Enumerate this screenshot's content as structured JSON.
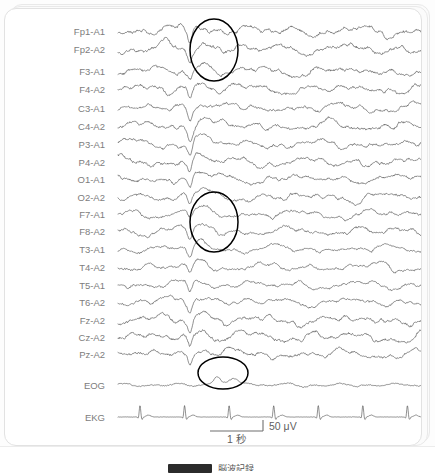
{
  "figure": {
    "background_color": "#ffffff",
    "trace_color": "#4a4a4a",
    "label_color": "#7d7d7d",
    "annotation_color": "#000000"
  },
  "channels": [
    {
      "label": "Fp1-A1",
      "y": 22,
      "amp": 5.0,
      "kind": "eeg"
    },
    {
      "label": "Fp2-A2",
      "y": 40,
      "amp": 5.2,
      "kind": "eeg"
    },
    {
      "label": "F3-A1",
      "y": 62,
      "amp": 4.6,
      "kind": "eeg"
    },
    {
      "label": "F4-A2",
      "y": 80,
      "amp": 4.8,
      "kind": "eeg"
    },
    {
      "label": "C3-A1",
      "y": 99,
      "amp": 4.4,
      "kind": "eeg"
    },
    {
      "label": "C4-A2",
      "y": 117,
      "amp": 4.6,
      "kind": "eeg"
    },
    {
      "label": "P3-A1",
      "y": 135,
      "amp": 4.3,
      "kind": "eeg"
    },
    {
      "label": "P4-A2",
      "y": 153,
      "amp": 4.5,
      "kind": "eeg"
    },
    {
      "label": "O1-A1",
      "y": 170,
      "amp": 4.2,
      "kind": "eeg"
    },
    {
      "label": "O2-A2",
      "y": 188,
      "amp": 4.4,
      "kind": "eeg"
    },
    {
      "label": "F7-A1",
      "y": 205,
      "amp": 4.0,
      "kind": "eeg"
    },
    {
      "label": "F8-A2",
      "y": 222,
      "amp": 4.1,
      "kind": "eeg"
    },
    {
      "label": "T3-A1",
      "y": 240,
      "amp": 3.6,
      "kind": "eeg"
    },
    {
      "label": "T4-A2",
      "y": 258,
      "amp": 3.8,
      "kind": "eeg"
    },
    {
      "label": "T5-A1",
      "y": 276,
      "amp": 3.7,
      "kind": "eeg"
    },
    {
      "label": "T6-A2",
      "y": 293,
      "amp": 3.9,
      "kind": "eeg"
    },
    {
      "label": "Fz-A2",
      "y": 311,
      "amp": 4.7,
      "kind": "eeg"
    },
    {
      "label": "Cz-A2",
      "y": 328,
      "amp": 4.9,
      "kind": "eeg"
    },
    {
      "label": "Pz-A2",
      "y": 345,
      "amp": 4.5,
      "kind": "eeg"
    },
    {
      "label": "EOG",
      "y": 376,
      "amp": 3.0,
      "kind": "eog"
    },
    {
      "label": "EKG",
      "y": 408,
      "amp": 1.0,
      "kind": "ekg"
    }
  ],
  "annotations": [
    {
      "name": "frontal-discharge",
      "cx": 209,
      "cy": 41,
      "rx": 24,
      "ry": 31
    },
    {
      "name": "temporal-discharge",
      "cx": 209,
      "cy": 213,
      "rx": 24,
      "ry": 30
    },
    {
      "name": "eog-deflection",
      "cx": 218,
      "cy": 364,
      "rx": 25,
      "ry": 16
    }
  ],
  "scale_bar": {
    "amplitude_label": "50 μV",
    "time_label": "1 秒",
    "x_start": 205,
    "x_end": 258,
    "y": 422,
    "tick_height": 11
  },
  "trace_area": {
    "x_start": 113,
    "x_end": 425,
    "label_right": 100
  },
  "banner": {
    "text": "脳波記録"
  },
  "chart_data": {
    "type": "line",
    "xlabel": "Time",
    "ylabel": "Channel",
    "x_unit": "second",
    "y_unit": "microvolt",
    "grid": false,
    "legend": "none",
    "time_scale_seconds_per_bar": 1,
    "amplitude_scale_microvolts_per_bar": 50,
    "duration_seconds": 6,
    "sampling_note": "19 scalp EEG channels referential to ipsilateral ear, plus EOG and EKG polygraphic channels",
    "event_time_seconds": 1.4,
    "event_description": "Generalized spike-and-slow-wave discharge, frontally dominant",
    "series": [
      {
        "name": "Fp1-A1",
        "amplitude_rel": 5.0
      },
      {
        "name": "Fp2-A2",
        "amplitude_rel": 5.2
      },
      {
        "name": "F3-A1",
        "amplitude_rel": 4.6
      },
      {
        "name": "F4-A2",
        "amplitude_rel": 4.8
      },
      {
        "name": "C3-A1",
        "amplitude_rel": 4.4
      },
      {
        "name": "C4-A2",
        "amplitude_rel": 4.6
      },
      {
        "name": "P3-A1",
        "amplitude_rel": 4.3
      },
      {
        "name": "P4-A2",
        "amplitude_rel": 4.5
      },
      {
        "name": "O1-A1",
        "amplitude_rel": 4.2
      },
      {
        "name": "O2-A2",
        "amplitude_rel": 4.4
      },
      {
        "name": "F7-A1",
        "amplitude_rel": 4.0
      },
      {
        "name": "F8-A2",
        "amplitude_rel": 4.1
      },
      {
        "name": "T3-A1",
        "amplitude_rel": 3.6
      },
      {
        "name": "T4-A2",
        "amplitude_rel": 3.8
      },
      {
        "name": "T5-A1",
        "amplitude_rel": 3.7
      },
      {
        "name": "T6-A2",
        "amplitude_rel": 3.9
      },
      {
        "name": "Fz-A2",
        "amplitude_rel": 4.7
      },
      {
        "name": "Cz-A2",
        "amplitude_rel": 4.9
      },
      {
        "name": "Pz-A2",
        "amplitude_rel": 4.5
      },
      {
        "name": "EOG",
        "amplitude_rel": 3.0
      },
      {
        "name": "EKG",
        "amplitude_rel": 1.0,
        "beats": 7
      }
    ]
  }
}
